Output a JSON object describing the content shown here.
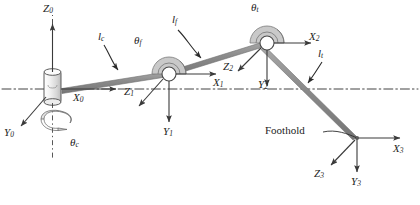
{
  "figure": {
    "colors": {
      "link": "#8c8c8c",
      "link_edge": "#6f6f6f",
      "axis": "#3a3a3a",
      "reference_line": "#2e2e2e",
      "joint_fill": "#ffffff",
      "joint_edge": "#4a4a4a",
      "arc_fill": "#c9c9c9",
      "background": "#ffffff",
      "text": "#232323"
    }
  },
  "frames": [
    {
      "name": "frame-0",
      "origin_label": "base",
      "axes": [
        {
          "id": "z0",
          "label": "Z",
          "sub": "0",
          "direction": "up"
        },
        {
          "id": "x0",
          "label": "X",
          "sub": "0",
          "direction": "right"
        },
        {
          "id": "y0",
          "label": "Y",
          "sub": "0",
          "direction": "down-left"
        }
      ]
    },
    {
      "name": "frame-1",
      "origin_label": "femur-joint",
      "axes": [
        {
          "id": "x1",
          "label": "X",
          "sub": "1",
          "direction": "right"
        },
        {
          "id": "y1",
          "label": "Y",
          "sub": "1",
          "direction": "down"
        },
        {
          "id": "z1",
          "label": "Z",
          "sub": "1",
          "direction": "down-left"
        }
      ]
    },
    {
      "name": "frame-2",
      "origin_label": "tibia-joint",
      "axes": [
        {
          "id": "x2",
          "label": "X",
          "sub": "2",
          "direction": "right"
        },
        {
          "id": "y2",
          "label": "Y",
          "sub": "2",
          "direction": "down"
        },
        {
          "id": "z2",
          "label": "Z",
          "sub": "2",
          "direction": "down-left"
        }
      ]
    },
    {
      "name": "frame-3",
      "origin_label": "foothold",
      "axes": [
        {
          "id": "x3",
          "label": "X",
          "sub": "3",
          "direction": "right"
        },
        {
          "id": "y3",
          "label": "Y",
          "sub": "3",
          "direction": "down"
        },
        {
          "id": "z3",
          "label": "Z",
          "sub": "3",
          "direction": "down-left"
        }
      ]
    }
  ],
  "links": [
    {
      "id": "lc",
      "label": "l",
      "sub": "c",
      "name": "coxa-link"
    },
    {
      "id": "lf",
      "label": "l",
      "sub": "f",
      "name": "femur-link"
    },
    {
      "id": "lt",
      "label": "l",
      "sub": "t",
      "name": "tibia-link"
    }
  ],
  "joint_angles": [
    {
      "id": "theta_c",
      "label": "θ",
      "sub": "c",
      "name": "coxa-rotation-angle"
    },
    {
      "id": "theta_f",
      "label": "θ",
      "sub": "f",
      "name": "femur-joint-angle"
    },
    {
      "id": "theta_t",
      "label": "θ",
      "sub": "t",
      "name": "tibia-joint-angle"
    }
  ],
  "annotations": {
    "foothold": "Foothold"
  }
}
